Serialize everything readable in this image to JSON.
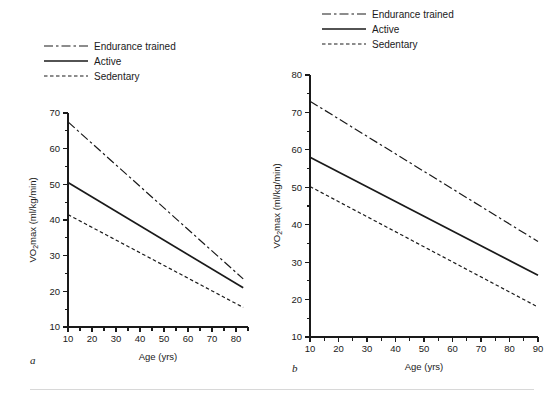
{
  "figure": {
    "background": "#ffffff",
    "ink_color": "#1a1a1a",
    "footer_rule_color": "#d8d8d8"
  },
  "legend": {
    "items": [
      {
        "label": "Endurance trained",
        "style": "dashdot",
        "dash": "9,3,2.5,3"
      },
      {
        "label": "Active",
        "style": "solid",
        "dash": "none"
      },
      {
        "label": "Sedentary",
        "style": "dashed",
        "dash": "3.5,2.5"
      }
    ]
  },
  "panels": [
    {
      "letter": "a",
      "legend_position": "above-left",
      "chart_data": {
        "type": "line",
        "title": "",
        "xlabel": "Age (yrs)",
        "ylabel": "VO2max (ml/kg/min)",
        "ylabel_parts": {
          "pre": "V",
          "sub": "2",
          "post": "max (ml/kg/min)",
          "lead": "O"
        },
        "x": [
          10,
          80
        ],
        "xlim": [
          10,
          85
        ],
        "ylim": [
          10,
          70
        ],
        "xticks": [
          10,
          20,
          30,
          40,
          50,
          60,
          70,
          80
        ],
        "xminor_step": 5,
        "yticks": [
          10,
          20,
          30,
          40,
          50,
          60,
          70
        ],
        "yminor_step": 5,
        "grid": false,
        "legend_position": "top-left",
        "series": [
          {
            "name": "Endurance trained",
            "style": "dashdot",
            "x": [
              10,
              83
            ],
            "values": [
              67.5,
              23.5
            ]
          },
          {
            "name": "Active",
            "style": "solid",
            "x": [
              10,
              83
            ],
            "values": [
              50.5,
              21.0
            ]
          },
          {
            "name": "Sedentary",
            "style": "dashed",
            "x": [
              10,
              83
            ],
            "values": [
              41.5,
              15.5
            ]
          }
        ]
      }
    },
    {
      "letter": "b",
      "legend_position": "above-left",
      "chart_data": {
        "type": "line",
        "title": "",
        "xlabel": "Age (yrs)",
        "ylabel": "VO2max (ml/kg/min)",
        "ylabel_parts": {
          "pre": "V",
          "sub": "2",
          "post": "max (ml/kg/min)",
          "lead": "O"
        },
        "x": [
          10,
          90
        ],
        "xlim": [
          10,
          90
        ],
        "ylim": [
          10,
          80
        ],
        "xticks": [
          10,
          20,
          30,
          40,
          50,
          60,
          70,
          80,
          90
        ],
        "xminor_step": 5,
        "yticks": [
          10,
          20,
          30,
          40,
          50,
          60,
          70,
          80
        ],
        "yminor_step": 5,
        "grid": false,
        "legend_position": "top-left",
        "series": [
          {
            "name": "Endurance trained",
            "style": "dashdot",
            "x": [
              10,
              90
            ],
            "values": [
              73.0,
              35.5
            ]
          },
          {
            "name": "Active",
            "style": "solid",
            "x": [
              10,
              90
            ],
            "values": [
              58.0,
              26.5
            ]
          },
          {
            "name": "Sedentary",
            "style": "dashed",
            "x": [
              10,
              90
            ],
            "values": [
              50.2,
              18.0
            ]
          }
        ]
      }
    }
  ]
}
